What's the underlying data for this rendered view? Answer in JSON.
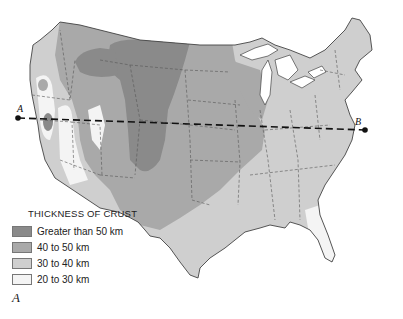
{
  "legend": {
    "title": "THICKNESS OF CRUST",
    "items": [
      {
        "label": "Greater than 50 km",
        "color": "#8a8a8a"
      },
      {
        "label": "40 to 50 km",
        "color": "#a9a9a9"
      },
      {
        "label": "30 to 40 km",
        "color": "#cfcfcf"
      },
      {
        "label": "20 to 30 km",
        "color": "#f4f4f4"
      }
    ]
  },
  "figure_label": "A",
  "profile": {
    "start_label": "A",
    "end_label": "B"
  },
  "colors": {
    "over50": "#8a8a8a",
    "40to50": "#a9a9a9",
    "30to40": "#cfcfcf",
    "20to30": "#f4f4f4",
    "background": "#ffffff",
    "border": "#444444"
  }
}
